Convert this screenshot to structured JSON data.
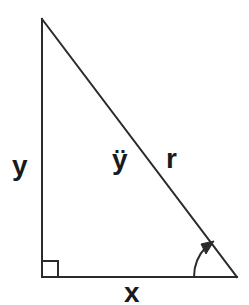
{
  "figure": {
    "background_color": "#ffffff",
    "stroke_color": "#2b2b2b",
    "text_color": "#1a1a1a",
    "stroke_width": 2,
    "width": 249,
    "height": 305
  },
  "labels": {
    "vertical_leg": "y",
    "hypotenuse_inner": "ÿ",
    "hypotenuse": "r",
    "horizontal_leg": "x"
  },
  "geometry": {
    "apex": {
      "x": 42,
      "y": 19
    },
    "bottom_left": {
      "x": 42,
      "y": 277
    },
    "bottom_right": {
      "x": 237,
      "y": 277
    },
    "right_angle_marker": {
      "x": 42,
      "y": 277,
      "size": 16
    },
    "angle_arc": {
      "radius": 43,
      "center_x": 237,
      "center_y": 277,
      "arrow": "arrowhead-up-right"
    }
  }
}
